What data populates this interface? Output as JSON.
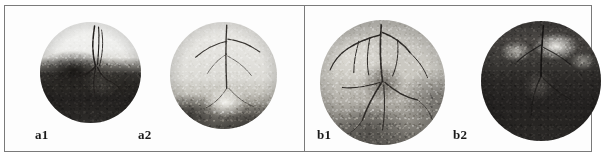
{
  "figure": {
    "kind": "retinal-fundus-photograph-montage",
    "frame_color": "#7a7a7a",
    "background_color": "#ffffff",
    "groups": [
      {
        "id": "a",
        "panels": [
          {
            "label": "a1",
            "description": "Fundus photograph: upper half pale/bright retina, dense dark pre-retinal haemorrhage covering lower half, neovascular frond with tortuous vessels rising from optic disc",
            "tone": "high-contrast"
          },
          {
            "label": "a2",
            "description": "Fundus photograph: mostly pale retina, prominent optic disc inferiorly, fine vessel arcade, dark band at lower left",
            "tone": "pale"
          }
        ]
      },
      {
        "id": "b",
        "panels": [
          {
            "label": "b1",
            "description": "Fundus photograph: speckled mid-grey retina with extensive branching vessel tree and dark optic disc at centre",
            "tone": "mid-grey"
          },
          {
            "label": "b2",
            "description": "Fundus photograph: predominantly dark retina with bright exudative patch in the upper region",
            "tone": "dark"
          }
        ]
      }
    ]
  }
}
